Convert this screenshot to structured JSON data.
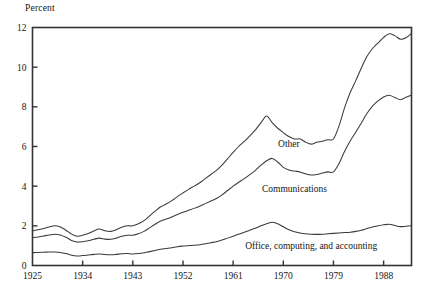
{
  "chart_data": {
    "type": "area",
    "title": "",
    "subtitle": "",
    "ylabel": "Percent",
    "xlabel": "",
    "grid": false,
    "legend_position": "inline-annotations",
    "ylim": [
      0,
      12
    ],
    "xlim": [
      1925,
      1993
    ],
    "yticks": [
      0,
      2,
      4,
      6,
      8,
      10,
      12
    ],
    "ytick_labels": [
      "0",
      "2",
      "4",
      "6",
      "8",
      "10",
      "12"
    ],
    "xticks": [
      1925,
      1934,
      1943,
      1952,
      1961,
      1970,
      1979,
      1988
    ],
    "xtick_labels": [
      "1925",
      "1934",
      "1943",
      "1952",
      "1961",
      "1970",
      "1979",
      "1988"
    ],
    "stacked": true,
    "annotations": [
      {
        "text": "Other",
        "x": 1971,
        "y": 6.0
      },
      {
        "text": "Communications",
        "x": 1972,
        "y": 3.7
      },
      {
        "text": "Office, computing, and accounting",
        "x": 1975,
        "y": 0.85
      }
    ],
    "x": [
      1925,
      1926,
      1927,
      1928,
      1929,
      1930,
      1931,
      1932,
      1933,
      1934,
      1935,
      1936,
      1937,
      1938,
      1939,
      1940,
      1941,
      1942,
      1943,
      1944,
      1945,
      1946,
      1947,
      1948,
      1949,
      1950,
      1951,
      1952,
      1953,
      1954,
      1955,
      1956,
      1957,
      1958,
      1959,
      1960,
      1961,
      1962,
      1963,
      1964,
      1965,
      1966,
      1967,
      1968,
      1969,
      1970,
      1971,
      1972,
      1973,
      1974,
      1975,
      1976,
      1977,
      1978,
      1979,
      1980,
      1981,
      1982,
      1983,
      1984,
      1985,
      1986,
      1987,
      1988,
      1989,
      1990,
      1991,
      1992,
      1993
    ],
    "series": [
      {
        "name": "Office, computing, and accounting",
        "values": [
          0.65,
          0.66,
          0.67,
          0.68,
          0.68,
          0.66,
          0.6,
          0.52,
          0.48,
          0.5,
          0.53,
          0.56,
          0.58,
          0.55,
          0.54,
          0.56,
          0.59,
          0.6,
          0.58,
          0.6,
          0.64,
          0.7,
          0.76,
          0.82,
          0.86,
          0.9,
          0.95,
          0.98,
          1.0,
          1.02,
          1.05,
          1.1,
          1.15,
          1.2,
          1.28,
          1.38,
          1.48,
          1.58,
          1.68,
          1.78,
          1.88,
          2.0,
          2.1,
          2.18,
          2.1,
          1.95,
          1.8,
          1.7,
          1.64,
          1.6,
          1.58,
          1.57,
          1.58,
          1.6,
          1.62,
          1.64,
          1.66,
          1.68,
          1.72,
          1.78,
          1.86,
          1.94,
          2.0,
          2.05,
          2.08,
          2.02,
          1.96,
          1.98,
          2.0
        ]
      },
      {
        "name": "Communications",
        "values": [
          0.75,
          0.78,
          0.82,
          0.86,
          0.9,
          0.88,
          0.82,
          0.74,
          0.7,
          0.7,
          0.72,
          0.76,
          0.8,
          0.78,
          0.78,
          0.82,
          0.88,
          0.92,
          0.95,
          1.0,
          1.08,
          1.2,
          1.32,
          1.42,
          1.48,
          1.55,
          1.62,
          1.7,
          1.78,
          1.86,
          1.94,
          2.02,
          2.1,
          2.18,
          2.28,
          2.4,
          2.52,
          2.62,
          2.7,
          2.8,
          2.92,
          3.06,
          3.18,
          3.22,
          3.12,
          3.0,
          3.02,
          3.06,
          3.08,
          3.02,
          2.98,
          3.02,
          3.08,
          3.12,
          3.1,
          3.5,
          4.1,
          4.6,
          5.0,
          5.4,
          5.8,
          6.1,
          6.3,
          6.45,
          6.5,
          6.45,
          6.4,
          6.5,
          6.6
        ]
      },
      {
        "name": "Other",
        "values": [
          0.35,
          0.36,
          0.38,
          0.4,
          0.42,
          0.4,
          0.36,
          0.32,
          0.3,
          0.32,
          0.36,
          0.42,
          0.46,
          0.42,
          0.4,
          0.42,
          0.46,
          0.48,
          0.47,
          0.5,
          0.54,
          0.6,
          0.66,
          0.72,
          0.76,
          0.82,
          0.9,
          0.98,
          1.06,
          1.12,
          1.18,
          1.26,
          1.34,
          1.42,
          1.5,
          1.6,
          1.7,
          1.8,
          1.88,
          1.96,
          2.04,
          2.14,
          2.26,
          1.8,
          1.7,
          1.75,
          1.68,
          1.62,
          1.66,
          1.6,
          1.56,
          1.62,
          1.6,
          1.62,
          1.66,
          1.9,
          2.2,
          2.44,
          2.6,
          2.78,
          2.88,
          2.9,
          2.92,
          3.0,
          3.1,
          3.12,
          3.05,
          3.0,
          3.1
        ]
      }
    ],
    "cumulative_top": {
      "name": "Total (top boundary)",
      "values": [
        1.75,
        1.8,
        1.87,
        1.94,
        2.0,
        1.94,
        1.78,
        1.58,
        1.48,
        1.52,
        1.61,
        1.74,
        1.84,
        1.75,
        1.72,
        1.8,
        1.93,
        2.0,
        2.0,
        2.1,
        2.26,
        2.5,
        2.74,
        2.96,
        3.1,
        3.27,
        3.47,
        3.66,
        3.84,
        4.0,
        4.17,
        4.38,
        4.59,
        4.8,
        5.06,
        5.38,
        5.7,
        6.0,
        6.26,
        6.54,
        6.84,
        7.2,
        7.54,
        7.2,
        6.92,
        6.7,
        6.5,
        6.38,
        6.38,
        6.22,
        6.12,
        6.21,
        6.26,
        6.34,
        6.38,
        7.04,
        7.96,
        8.72,
        9.32,
        9.96,
        10.54,
        10.94,
        11.22,
        11.5,
        11.68,
        11.59,
        11.41,
        11.48,
        11.7
      ]
    }
  }
}
